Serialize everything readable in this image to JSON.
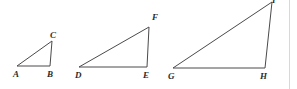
{
  "figure": {
    "background_color": "#ffffff",
    "stroke_color": "#4a4a4a",
    "label_color": "#2b2b2b",
    "width": 297,
    "height": 89,
    "border_line_color": "#d8d8d8"
  },
  "triangles": [
    {
      "name": "triangle-abc",
      "vertices": [
        {
          "label": "A",
          "x": 17,
          "y": 66,
          "label_x": 13,
          "label_y": 70
        },
        {
          "label": "B",
          "x": 50,
          "y": 66,
          "label_x": 47,
          "label_y": 70
        },
        {
          "label": "C",
          "x": 52,
          "y": 41,
          "label_x": 50,
          "label_y": 31
        }
      ]
    },
    {
      "name": "triangle-def",
      "vertices": [
        {
          "label": "D",
          "x": 79,
          "y": 67,
          "label_x": 75,
          "label_y": 71
        },
        {
          "label": "E",
          "x": 147,
          "y": 67,
          "label_x": 143,
          "label_y": 71
        },
        {
          "label": "F",
          "x": 149,
          "y": 27,
          "label_x": 152,
          "label_y": 13
        }
      ]
    },
    {
      "name": "triangle-ghi",
      "vertices": [
        {
          "label": "G",
          "x": 173,
          "y": 68,
          "label_x": 168,
          "label_y": 72
        },
        {
          "label": "H",
          "x": 265,
          "y": 68,
          "label_x": 260,
          "label_y": 72
        },
        {
          "label": "I",
          "x": 272,
          "y": 2,
          "label_x": 272,
          "label_y": -4
        }
      ]
    }
  ]
}
